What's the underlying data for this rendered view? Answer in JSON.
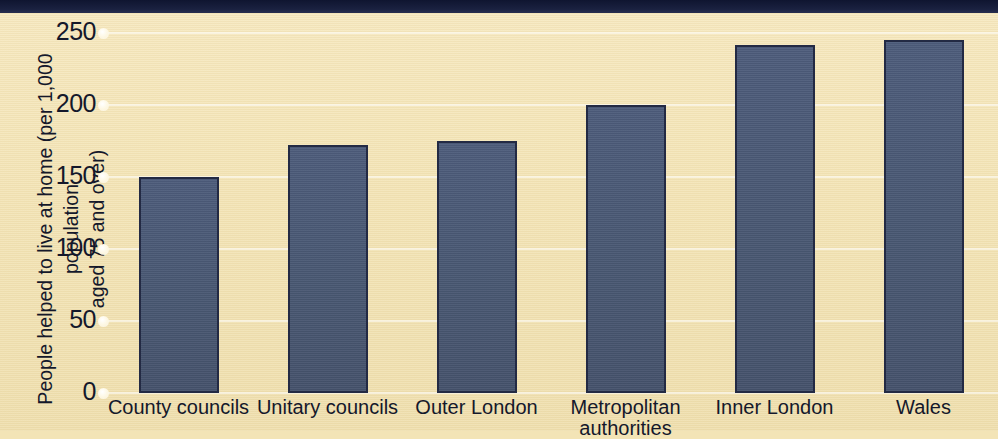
{
  "chart_data": {
    "type": "bar",
    "title": "",
    "xlabel": "",
    "ylabel": "People helped to live at home (per 1,000 population\naged 75 and over)",
    "categories": [
      "County councils",
      "Unitary councils",
      "Outer London",
      "Metropolitan\nauthorities",
      "Inner London",
      "Wales"
    ],
    "values": [
      150,
      172,
      175,
      200,
      242,
      245
    ],
    "ylim": [
      0,
      250
    ],
    "yticks": [
      0,
      50,
      100,
      150,
      200,
      250
    ],
    "ytick_labels": [
      "0",
      "50",
      "100",
      "150",
      "200",
      "250"
    ],
    "grid": true,
    "legend": "none",
    "series": [
      {
        "name": "People helped to live at home",
        "values": [
          150,
          172,
          175,
          200,
          242,
          245
        ]
      }
    ]
  },
  "colors": {
    "background": "#f3e4b6",
    "bar_fill": "#4a5974",
    "bar_border": "#232a44",
    "top_band": "#1a2140",
    "gridline": "#ffffff",
    "text": "#14182b"
  }
}
